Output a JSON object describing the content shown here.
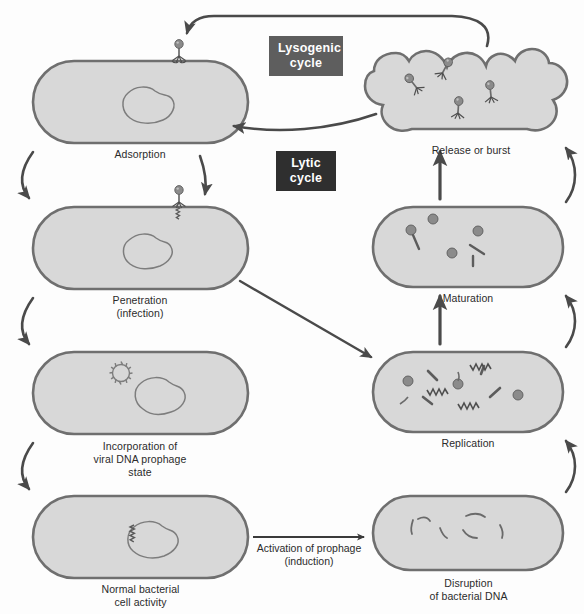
{
  "diagram": {
    "colors": {
      "cell_fill": "#d8d8d8",
      "cell_stroke": "#6f6f6f",
      "dna_stroke": "#7d7d7d",
      "arrow": "#4a4a4a",
      "lysogenic_box_bg": "#5e5e5e",
      "lytic_box_bg": "#2f2f2f",
      "label_text": "#2b2b2b",
      "box_text": "#ffffff",
      "background": "#fdfdfd"
    },
    "cycles": [
      {
        "id": "lysogenic",
        "label": "Lysogenic\ncycle"
      },
      {
        "id": "lytic",
        "label": "Lytic\ncycle"
      }
    ],
    "stages": [
      {
        "id": "adsorption",
        "label": "Adsorption"
      },
      {
        "id": "penetration",
        "label": "Penetration\n(infection)"
      },
      {
        "id": "incorporation",
        "label": "Incorporation of\nviral DNA prophage\nstate"
      },
      {
        "id": "normal-activity",
        "label": "Normal bacterial\ncell activity"
      },
      {
        "id": "disruption",
        "label": "Disruption\nof bacterial DNA"
      },
      {
        "id": "replication",
        "label": "Replication"
      },
      {
        "id": "maturation",
        "label": "Maturation"
      },
      {
        "id": "release",
        "label": "Release or burst"
      }
    ],
    "transitions": [
      {
        "id": "induction",
        "label": "Activation of prophage\n(induction)"
      }
    ]
  }
}
